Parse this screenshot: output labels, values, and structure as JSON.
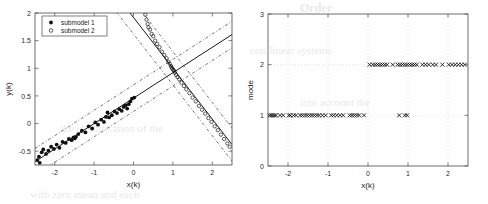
{
  "figure": {
    "background": "#ffffff",
    "ink": "#1a1a1a"
  },
  "left_panel": {
    "name": "regression-scatter-plot",
    "legend": {
      "entries": [
        {
          "label": "submodel 1",
          "marker": "filled-circle"
        },
        {
          "label": "submodel 2",
          "marker": "open-circle"
        }
      ]
    }
  },
  "right_panel": {
    "name": "mode-sequence-plot"
  },
  "chart_data": [
    {
      "type": "scatter",
      "title": "",
      "xlabel": "x(k)",
      "ylabel": "y(k)",
      "xlim": [
        -2.5,
        2.5
      ],
      "ylim": [
        -0.75,
        2.0
      ],
      "xticks": [
        -2,
        -1,
        0,
        1,
        2
      ],
      "xticklabels": [
        "-2",
        "-1",
        "0",
        "1",
        "2"
      ],
      "yticks": [
        -0.5,
        0,
        0.5,
        1,
        1.5,
        2
      ],
      "yticklabels": [
        "-0.5",
        "0",
        "0.5",
        "1",
        "1.5",
        "2"
      ],
      "grid": false,
      "legend_position": "upper-left",
      "legend": [
        "submodel 1",
        "submodel 2"
      ],
      "series": [
        {
          "name": "submodel 1",
          "marker": "filled-circle",
          "color": "#101010",
          "points": [
            [
              -2.44,
              -0.66
            ],
            [
              -2.4,
              -0.6
            ],
            [
              -2.38,
              -0.71
            ],
            [
              -2.33,
              -0.52
            ],
            [
              -2.29,
              -0.47
            ],
            [
              -2.22,
              -0.55
            ],
            [
              -2.16,
              -0.49
            ],
            [
              -2.09,
              -0.42
            ],
            [
              -2.02,
              -0.46
            ],
            [
              -1.95,
              -0.38
            ],
            [
              -1.88,
              -0.44
            ],
            [
              -1.8,
              -0.33
            ],
            [
              -1.72,
              -0.35
            ],
            [
              -1.64,
              -0.28
            ],
            [
              -1.57,
              -0.3
            ],
            [
              -1.52,
              -0.25
            ],
            [
              -1.49,
              -0.27
            ],
            [
              -1.46,
              -0.24
            ],
            [
              -1.4,
              -0.19
            ],
            [
              -1.31,
              -0.13
            ],
            [
              -1.22,
              -0.16
            ],
            [
              -1.14,
              -0.05
            ],
            [
              -1.05,
              -0.09
            ],
            [
              -0.97,
              0.02
            ],
            [
              -0.9,
              -0.02
            ],
            [
              -0.82,
              0.07
            ],
            [
              -0.75,
              0.03
            ],
            [
              -0.7,
              0.12
            ],
            [
              -0.66,
              0.2
            ],
            [
              -0.62,
              0.11
            ],
            [
              -0.55,
              0.15
            ],
            [
              -0.48,
              0.22
            ],
            [
              -0.42,
              0.19
            ],
            [
              -0.36,
              0.26
            ],
            [
              -0.3,
              0.23
            ],
            [
              -0.25,
              0.3
            ],
            [
              -0.2,
              0.33
            ],
            [
              -0.16,
              0.27
            ],
            [
              -0.12,
              0.35
            ],
            [
              -0.08,
              0.4
            ],
            [
              -0.04,
              0.45
            ],
            [
              0.02,
              0.47
            ]
          ]
        },
        {
          "name": "submodel 2",
          "marker": "open-circle",
          "color": "#1a1a1a",
          "points": [
            [
              0.3,
              1.97
            ],
            [
              0.33,
              1.88
            ],
            [
              0.36,
              1.8
            ],
            [
              0.38,
              1.74
            ],
            [
              0.42,
              1.7
            ],
            [
              0.46,
              1.62
            ],
            [
              0.5,
              1.58
            ],
            [
              0.55,
              1.5
            ],
            [
              0.6,
              1.44
            ],
            [
              0.66,
              1.38
            ],
            [
              0.72,
              1.3
            ],
            [
              0.78,
              1.24
            ],
            [
              0.84,
              1.18
            ],
            [
              0.88,
              1.12
            ],
            [
              0.92,
              1.08
            ],
            [
              0.95,
              1.04
            ],
            [
              0.97,
              1.01
            ],
            [
              0.99,
              0.99
            ],
            [
              1.01,
              0.97
            ],
            [
              1.03,
              0.95
            ],
            [
              1.05,
              0.92
            ],
            [
              1.08,
              0.88
            ],
            [
              1.12,
              0.84
            ],
            [
              1.16,
              0.8
            ],
            [
              1.22,
              0.74
            ],
            [
              1.28,
              0.68
            ],
            [
              1.34,
              0.62
            ],
            [
              1.42,
              0.55
            ],
            [
              1.5,
              0.47
            ],
            [
              1.58,
              0.4
            ],
            [
              1.66,
              0.32
            ],
            [
              1.74,
              0.25
            ],
            [
              1.82,
              0.18
            ],
            [
              1.9,
              0.1
            ],
            [
              1.98,
              0.03
            ],
            [
              2.06,
              -0.05
            ],
            [
              2.14,
              -0.12
            ],
            [
              2.22,
              -0.2
            ],
            [
              2.3,
              -0.28
            ],
            [
              2.38,
              -0.36
            ],
            [
              2.44,
              -0.42
            ]
          ]
        }
      ],
      "fit_lines": [
        {
          "name": "submodel-1-fit",
          "slope": 0.46,
          "intercept": 0.46,
          "x_from": -2.5,
          "x_to": 2.5,
          "style": "solid"
        },
        {
          "name": "submodel-2-fit",
          "slope": -0.92,
          "intercept": 1.92,
          "x_from": -0.1,
          "x_to": 2.5,
          "style": "solid"
        }
      ],
      "bound_lines": [
        {
          "name": "submodel-1-upper",
          "slope": 0.46,
          "intercept": 0.7,
          "style": "dash-dot"
        },
        {
          "name": "submodel-1-lower",
          "slope": 0.46,
          "intercept": 0.22,
          "style": "dash-dot"
        },
        {
          "name": "submodel-2-upper",
          "slope": -0.92,
          "intercept": 2.22,
          "style": "dash-dot"
        },
        {
          "name": "submodel-2-lower",
          "slope": -0.92,
          "intercept": 1.62,
          "style": "dash-dot"
        }
      ]
    },
    {
      "type": "scatter",
      "title": "",
      "xlabel": "x(k)",
      "ylabel": "mode",
      "xlim": [
        -2.5,
        2.5
      ],
      "ylim": [
        0,
        3
      ],
      "xticks": [
        -2,
        -1,
        0,
        1,
        2
      ],
      "xticklabels": [
        "-2",
        "-1",
        "0",
        "1",
        "2"
      ],
      "yticks": [
        0,
        1,
        2,
        3
      ],
      "yticklabels": [
        "0",
        "1",
        "2",
        "3"
      ],
      "grid": true,
      "marker": "x-cross",
      "series": [
        {
          "name": "mode 1",
          "mode_value": 1,
          "x": [
            -2.46,
            -2.42,
            -2.38,
            -2.34,
            -2.3,
            -2.2,
            -2.12,
            -1.98,
            -1.94,
            -1.86,
            -1.8,
            -1.7,
            -1.64,
            -1.58,
            -1.52,
            -1.46,
            -1.4,
            -1.34,
            -1.28,
            -1.22,
            -1.14,
            -1.06,
            -0.92,
            -0.86,
            -0.78,
            -0.7,
            -0.62,
            -0.46,
            -0.4,
            -0.34,
            -0.28,
            -0.22,
            -0.1,
            0.78,
            0.92,
            0.98
          ]
        },
        {
          "name": "mode 2",
          "mode_value": 2,
          "x": [
            0.04,
            0.12,
            0.18,
            0.24,
            0.3,
            0.36,
            0.42,
            0.48,
            0.62,
            0.74,
            0.8,
            0.86,
            0.92,
            0.98,
            1.04,
            1.1,
            1.16,
            1.22,
            1.36,
            1.44,
            1.52,
            1.62,
            1.7,
            1.86,
            2.02,
            2.1,
            2.18,
            2.26,
            2.34,
            2.42
          ]
        }
      ]
    }
  ],
  "bleed_text": {
    "lines": [
      "Order",
      "the identification of the",
      "into account the",
      "non linear systems",
      "with zero mean and each"
    ]
  }
}
